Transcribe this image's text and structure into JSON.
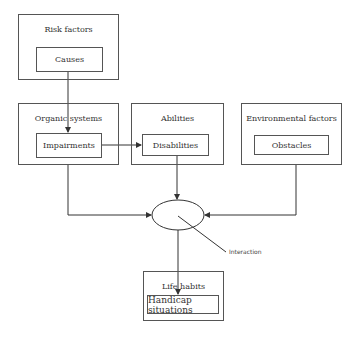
{
  "diagram": {
    "nodes": {
      "risk_factors": {
        "title": "Risk factors",
        "inner": "Causes"
      },
      "organic_systems": {
        "title": "Organic systems",
        "inner": "Impairments"
      },
      "abilities": {
        "title": "Abilities",
        "inner": "Disabilities"
      },
      "environmental_factors": {
        "title": "Environmental factors",
        "inner": "Obstacles"
      },
      "life_habits": {
        "title": "Life habits",
        "inner": "Handicap situations"
      }
    },
    "interaction_label": "Interaction",
    "edges": [
      {
        "from": "Causes",
        "to": "Impairments"
      },
      {
        "from": "Impairments",
        "to": "Disabilities"
      },
      {
        "from": "Impairments",
        "to": "Interaction"
      },
      {
        "from": "Disabilities",
        "to": "Interaction"
      },
      {
        "from": "Obstacles",
        "to": "Interaction"
      },
      {
        "from": "Interaction",
        "to": "Handicap situations"
      }
    ]
  }
}
